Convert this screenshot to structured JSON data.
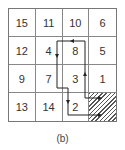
{
  "figure": {
    "caption": "(b)",
    "grid": {
      "rows": 4,
      "cols": 4,
      "cells": [
        [
          "15",
          "11",
          "10",
          "6"
        ],
        [
          "12",
          "4",
          "8",
          "5"
        ],
        [
          "9",
          "7",
          "3",
          "1"
        ],
        [
          "13",
          "14",
          "2",
          ""
        ]
      ],
      "hatched_cell": {
        "row": 3,
        "col": 3
      }
    },
    "path": {
      "description": "Two routes with arrows ending in hatched bottom-right cell",
      "color": "#222222"
    }
  }
}
